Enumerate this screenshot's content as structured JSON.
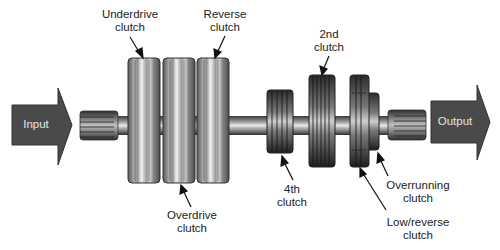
{
  "diagram": {
    "input_label": "Input",
    "output_label": "Output",
    "colors": {
      "arrow_fill": "#4a4a4a",
      "clutch_light": "#b8b8b8",
      "clutch_dark": "#3a3a3a",
      "shaft": "#8a8a8a",
      "text": "#222222"
    },
    "clutches": [
      {
        "id": "underdrive",
        "line1": "Underdrive",
        "line2": "clutch"
      },
      {
        "id": "overdrive",
        "line1": "Overdrive",
        "line2": "clutch"
      },
      {
        "id": "reverse",
        "line1": "Reverse",
        "line2": "clutch"
      },
      {
        "id": "fourth",
        "line1": "4th",
        "line2": "clutch"
      },
      {
        "id": "second",
        "line1": "2nd",
        "line2": "clutch"
      },
      {
        "id": "low-reverse",
        "line1": "Low/reverse",
        "line2": "clutch"
      },
      {
        "id": "overrunning",
        "line1": "Overrunning",
        "line2": "clutch"
      }
    ]
  }
}
